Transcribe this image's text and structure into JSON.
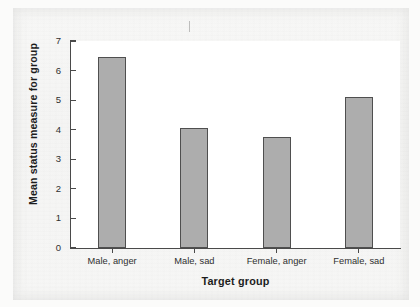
{
  "chart_data": {
    "type": "bar",
    "title": "",
    "subtitle": "",
    "xlabel": "Target group",
    "ylabel": "Mean status measure for group",
    "categories": [
      "Male, anger",
      "Male, sad",
      "Female, anger",
      "Female, sad"
    ],
    "values": [
      6.45,
      4.05,
      3.75,
      5.1
    ],
    "ylim": [
      0,
      7
    ],
    "yticks": [
      "0",
      "1",
      "2",
      "3",
      "4",
      "5",
      "6",
      "7"
    ],
    "ytick_values": [
      0,
      1,
      2,
      3,
      4,
      5,
      6,
      7
    ],
    "grid": false,
    "legend": null,
    "legend_position": "none",
    "series": [
      {
        "name": "Mean status measure for group",
        "values": [
          6.45,
          4.05,
          3.75,
          5.1
        ]
      }
    ],
    "annotations": [],
    "bar_fill_color": "#adadad",
    "bar_edge_color": "#4f4f4f",
    "axis_color": "#4a4a4a",
    "plot_background": "#ffffff",
    "page_background": "#f6f6f5"
  }
}
